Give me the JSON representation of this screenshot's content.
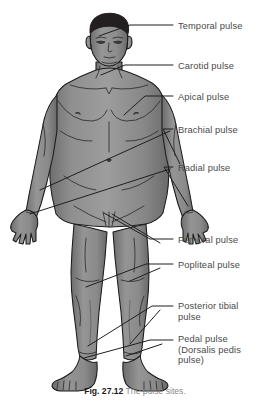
{
  "figure": {
    "title_number": "Fig. 27.12",
    "title_text": "The pulse sites.",
    "colors": {
      "background": "#ffffff",
      "body_fill": "#8d8d8d",
      "body_shade": "#6e6e6e",
      "body_highlight": "#a2a2a2",
      "outline": "#1a1a1a",
      "hair": "#231f20",
      "label_text": "#4a4a4a",
      "leader_line": "#2a2a2a",
      "caption_number": "#1a1a1a",
      "caption_text": "#8a8a8a"
    }
  },
  "labels": [
    {
      "id": "temporal",
      "text": "Temporal pulse",
      "x": 178,
      "y": 26
    },
    {
      "id": "carotid",
      "text": "Carotid pulse",
      "x": 178,
      "y": 66
    },
    {
      "id": "apical",
      "text": "Apical pulse",
      "x": 178,
      "y": 97
    },
    {
      "id": "brachial",
      "text": "Brachial pulse",
      "x": 178,
      "y": 130
    },
    {
      "id": "radial",
      "text": "Radial pulse",
      "x": 178,
      "y": 168
    },
    {
      "id": "femoral",
      "text": "Femoral pulse",
      "x": 178,
      "y": 240
    },
    {
      "id": "popliteal",
      "text": "Popliteal pulse",
      "x": 178,
      "y": 265
    },
    {
      "id": "posterior-tibial",
      "text": "Posterior tibial\npulse",
      "x": 178,
      "y": 307
    },
    {
      "id": "pedal",
      "text": "Pedal pulse\n(Dorsalis pedis\npulse)",
      "x": 178,
      "y": 341
    }
  ]
}
